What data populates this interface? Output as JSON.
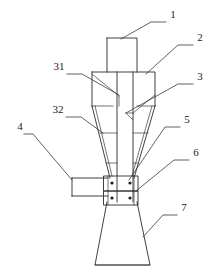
{
  "figure": {
    "type": "patent-line-drawing",
    "width": 220,
    "height": 276,
    "background_color": "#ffffff",
    "line_color": "#2a2a2a"
  },
  "callouts": [
    {
      "id": "1",
      "label": "1",
      "x": 173,
      "y": 18,
      "leader": "M166,22 L151,22 L121,39"
    },
    {
      "id": "2",
      "label": "2",
      "x": 200,
      "y": 41,
      "leader": "M193,45 L178,45 L146,74"
    },
    {
      "id": "3",
      "label": "3",
      "x": 200,
      "y": 80,
      "leader": "M193,84 L178,84 L126,113"
    },
    {
      "id": "31",
      "label": "31",
      "x": 59,
      "y": 70,
      "leader": "M67,74 L82,74 L119,95"
    },
    {
      "id": "32",
      "label": "32",
      "x": 58,
      "y": 113,
      "leader": "M66,117 L81,117 L103,133"
    },
    {
      "id": "4",
      "label": "4",
      "x": 20,
      "y": 130,
      "leader": "M24,134 L33,134 L72,180"
    },
    {
      "id": "5",
      "label": "5",
      "x": 187,
      "y": 123,
      "leader": "M180,127 L165,127 L129,180"
    },
    {
      "id": "6",
      "label": "6",
      "x": 196,
      "y": 156,
      "leader": "M189,160 L174,160 L136,191"
    },
    {
      "id": "7",
      "label": "7",
      "x": 184,
      "y": 211,
      "leader": "M177,215 L163,215 L143,237"
    }
  ],
  "geometry": {
    "inlet_duct": {
      "x": 107,
      "y": 38,
      "width": 30,
      "height": 34
    },
    "upper_barrel": {
      "x": 92,
      "y": 72,
      "width": 63,
      "height": 34
    },
    "center_tube": {
      "left": 117,
      "right": 133,
      "top": 38,
      "bottom": 202
    },
    "cone_top_y": 106,
    "cone_bottom_y": 178,
    "side_inlet_duct": {
      "x": 72,
      "y": 178,
      "width": 36,
      "height": 18
    },
    "flange_upper": {
      "x": 104,
      "y": 176,
      "width": 34,
      "height": 15
    },
    "flange_lower": {
      "x": 104,
      "y": 191,
      "width": 34,
      "height": 14
    },
    "skirt": {
      "top_y": 202,
      "bottom_y": 265,
      "top_left": 107,
      "top_right": 137,
      "bottom_left": 95,
      "bottom_right": 150
    },
    "bolt_dots": [
      {
        "cx": 112,
        "cy": 183
      },
      {
        "cx": 130,
        "cy": 183
      },
      {
        "cx": 112,
        "cy": 198
      },
      {
        "cx": 130,
        "cy": 198
      }
    ]
  }
}
